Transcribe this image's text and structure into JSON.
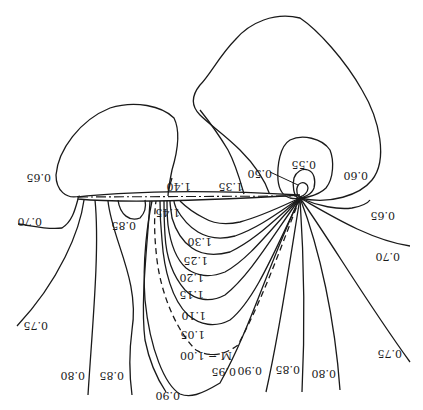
{
  "figure": {
    "orientation": "upside-down",
    "contour_labels": {
      "m050": "0.50",
      "m055": "0.55",
      "m060": "0.60",
      "m065_left": "0.65",
      "m065_right": "0.65",
      "m070_left": "0.70",
      "m070_right": "0.70",
      "m075_left": "0.75",
      "m075_right": "0.75",
      "m080_left": "0.80",
      "m080_right": "0.80",
      "m085_left": "0.85",
      "m085_top": "0.85",
      "m085_right": "0.85",
      "m090_left": "0.90",
      "m090_right": "0.90",
      "m095": "0.95",
      "m100": "M = 1.00",
      "m105": "1.05",
      "m110": "1.10",
      "m115": "1.15",
      "m120": "1.20",
      "m125": "1.25",
      "m130": "1.30",
      "m135": "1.35",
      "m140": "1.40",
      "m145": "1.45"
    }
  }
}
